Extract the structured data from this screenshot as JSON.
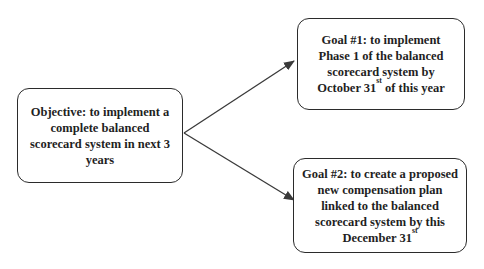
{
  "colors": {
    "background": "#ffffff",
    "text": "#1f1f1f",
    "border": "#2b2b2b",
    "arrow": "#3a3a3a"
  },
  "boxes": {
    "objective": {
      "lines": [
        {
          "pre": "Objective: to implement a"
        },
        {
          "pre": "complete balanced"
        },
        {
          "pre": "scorecard system in next 3"
        },
        {
          "pre": "years"
        }
      ]
    },
    "goal1": {
      "lines": [
        {
          "pre": "Goal #1: to implement"
        },
        {
          "pre": "Phase 1 of the balanced"
        },
        {
          "pre": "scorecard system by"
        },
        {
          "pre": "October 31",
          "sup": "st",
          "post": " of this year"
        }
      ]
    },
    "goal2": {
      "lines": [
        {
          "pre": "Goal #2: to create a proposed"
        },
        {
          "pre": "new compensation plan"
        },
        {
          "pre": "linked to the balanced"
        },
        {
          "pre": "scorecard system by this"
        },
        {
          "pre": "December 31",
          "sup": "st",
          "post": ""
        }
      ]
    }
  },
  "arrows": [
    {
      "from": "objective-box",
      "to": "goal1-box"
    },
    {
      "from": "objective-box",
      "to": "goal2-box"
    }
  ]
}
